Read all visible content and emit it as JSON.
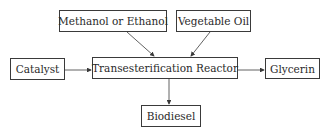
{
  "diagram": {
    "nodes": {
      "methanol": {
        "label": "Methanol or Ethanol"
      },
      "vegoil": {
        "label": "Vegetable Oil"
      },
      "catalyst": {
        "label": "Catalyst"
      },
      "reactor": {
        "label": "Transesterification Reactor"
      },
      "glycerin": {
        "label": "Glycerin"
      },
      "biodiesel": {
        "label": "Biodiesel"
      }
    },
    "edges": [
      {
        "from": "Methanol or Ethanol",
        "to": "Transesterification Reactor"
      },
      {
        "from": "Vegetable Oil",
        "to": "Transesterification Reactor"
      },
      {
        "from": "Catalyst",
        "to": "Transesterification Reactor"
      },
      {
        "from": "Transesterification Reactor",
        "to": "Glycerin"
      },
      {
        "from": "Transesterification Reactor",
        "to": "Biodiesel"
      }
    ],
    "colors": {
      "stroke": "#3a3a3a",
      "text": "#2a2a2a",
      "background": "#ffffff"
    }
  }
}
